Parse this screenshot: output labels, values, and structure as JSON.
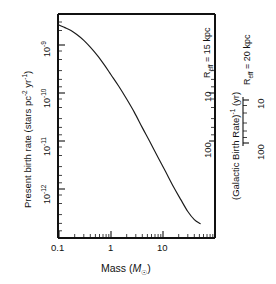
{
  "chart_data": {
    "type": "line",
    "title": "",
    "xlabel": "Mass (M☉)",
    "ylabel": "Present birth rate (stars pc⁻² yr⁻¹)",
    "xscale": "log",
    "yscale": "log",
    "xlim": [
      0.08,
      60
    ],
    "ylim": [
      2e-13,
      3.2e-09
    ],
    "grid": false,
    "legend": null,
    "x_ticklabels": [
      "0.1",
      "1",
      "10"
    ],
    "x_tickvalues": [
      0.1,
      1,
      10
    ],
    "y_ticklabels": [
      "10⁻⁹",
      "10⁻¹⁰",
      "10⁻¹¹",
      "10⁻¹²"
    ],
    "y_tickvalues": [
      1e-09,
      1e-10,
      1e-11,
      1e-12
    ],
    "series": [
      {
        "name": "Present birth rate",
        "x": [
          0.09,
          0.1,
          0.13,
          0.17,
          0.22,
          0.3,
          0.4,
          0.55,
          0.75,
          1.0,
          1.4,
          2.0,
          2.8,
          4.0,
          5.5,
          8.0,
          11.0,
          16.0,
          22.0,
          30.0,
          40.0,
          52.0
        ],
        "y": [
          2.7e-09,
          2.6e-09,
          2.3e-09,
          2e-09,
          1.65e-09,
          1.25e-09,
          9e-10,
          6e-10,
          3.8e-10,
          2.4e-10,
          1.4e-10,
          7.5e-11,
          4e-11,
          1.9e-11,
          1e-11,
          4.6e-12,
          2.4e-12,
          1.1e-12,
          6e-13,
          3.4e-13,
          2.3e-13,
          1.9e-13
        ]
      }
    ],
    "secondary_axes": [
      {
        "name": "R_eff = 15 kpc",
        "label": "Rₑᶠᶠ = 15 kpc",
        "label_main": "R",
        "label_sub": "eff",
        "label_rest": " = 15 kpc",
        "ticklabels": [
          "10",
          "100"
        ],
        "tickvalues": [
          10,
          100
        ],
        "scale": "log"
      },
      {
        "name": "R_eff = 20 kpc",
        "label": "Rₑᶠᶠ = 20 kpc",
        "label_main": "R",
        "label_sub": "eff",
        "label_rest": " = 20 kpc",
        "ticklabels": [
          "10",
          "100"
        ],
        "tickvalues": [
          10,
          100
        ],
        "scale": "log",
        "axis_title": "(Galactic Birth Rate)⁻¹ (yr)"
      }
    ]
  },
  "labels": {
    "y_axis_title": "Present birth rate (stars pc",
    "y_axis_title_sup1": "-2",
    "y_axis_title_mid": " yr",
    "y_axis_title_sup2": "-1",
    "y_axis_title_end": ")",
    "x_axis_title_main": "Mass (",
    "x_axis_title_M": "M",
    "x_axis_title_sub": "☉",
    "x_axis_title_end": ")",
    "ytick1": "10",
    "ytick1_exp": "-9",
    "ytick2": "10",
    "ytick2_exp": "-10",
    "ytick3": "10",
    "ytick3_exp": "-11",
    "ytick4": "10",
    "ytick4_exp": "-12",
    "xtick1": "0.1",
    "xtick2": "1",
    "xtick3": "10",
    "reff15_R": "R",
    "reff15_sub": "eff",
    "reff15_rest": " = 15 kpc",
    "reff15_t10": "10",
    "reff15_t100": "100",
    "reff20_R": "R",
    "reff20_sub": "eff",
    "reff20_rest": " = 20 kpc",
    "reff20_t10": "10",
    "reff20_t100": "100",
    "gbr_title_main": "(Galactic Birth Rate)",
    "gbr_title_sup": "-1",
    "gbr_title_end": " (yr)"
  },
  "colors": {
    "ink": "#111111",
    "curve": "#1a1a1a",
    "background": "#ffffff"
  }
}
